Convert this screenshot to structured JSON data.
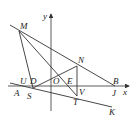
{
  "figure": {
    "axes": {
      "x_label": "x",
      "y_label": "y",
      "origin_label": "O"
    },
    "points": [
      {
        "label": "M",
        "x": 19,
        "y": 31,
        "lx": 20,
        "ly": 29
      },
      {
        "label": "N",
        "x": 77,
        "y": 66,
        "lx": 78,
        "ly": 63
      },
      {
        "label": "B",
        "x": 115,
        "y": 86,
        "lx": 114,
        "ly": 84
      },
      {
        "label": "U",
        "x": 27,
        "y": 86,
        "lx": 19,
        "ly": 84
      },
      {
        "label": "D",
        "x": 33,
        "y": 86,
        "lx": 30,
        "ly": 84
      },
      {
        "label": "O",
        "x": 51,
        "y": 86,
        "lx": 52,
        "ly": 84
      },
      {
        "label": "E",
        "x": 73,
        "y": 86,
        "lx": 67,
        "ly": 84
      },
      {
        "label": "A",
        "x": 10,
        "y": 86,
        "lx": 15,
        "ly": 95
      },
      {
        "label": "S",
        "x": 33,
        "y": 88,
        "lx": 27,
        "ly": 98
      },
      {
        "label": "V",
        "x": 77,
        "y": 86,
        "lx": 79,
        "ly": 94
      },
      {
        "label": "J",
        "x": 115,
        "y": 86,
        "lx": 112,
        "ly": 95
      },
      {
        "label": "T",
        "x": 77,
        "y": 96,
        "lx": 73,
        "ly": 104
      },
      {
        "label": "K",
        "x": 112,
        "y": 107,
        "lx": 110,
        "ly": 115
      }
    ]
  }
}
